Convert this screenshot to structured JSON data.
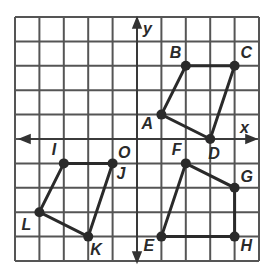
{
  "diagram": {
    "type": "coordinate-grid",
    "grid": {
      "x_min": -5,
      "x_max": 5,
      "y_min": -5,
      "y_max": 5,
      "step": 1
    },
    "axes": {
      "x_label": "x",
      "y_label": "y"
    },
    "origin_label": "O",
    "colors": {
      "grid": "#555555",
      "shape": "#2a2a2a",
      "background": "#ffffff"
    },
    "quadrilaterals": [
      {
        "name": "ABCD",
        "vertices": [
          {
            "label": "A",
            "x": 1,
            "y": 1
          },
          {
            "label": "B",
            "x": 2,
            "y": 3
          },
          {
            "label": "C",
            "x": 4,
            "y": 3
          },
          {
            "label": "D",
            "x": 3,
            "y": 0
          }
        ]
      },
      {
        "name": "EFGH",
        "vertices": [
          {
            "label": "E",
            "x": 1,
            "y": -4
          },
          {
            "label": "F",
            "x": 2,
            "y": -1
          },
          {
            "label": "G",
            "x": 4,
            "y": -2
          },
          {
            "label": "H",
            "x": 4,
            "y": -4
          }
        ]
      },
      {
        "name": "IJKL",
        "vertices": [
          {
            "label": "I",
            "x": -3,
            "y": -1
          },
          {
            "label": "J",
            "x": -1,
            "y": -1
          },
          {
            "label": "K",
            "x": -2,
            "y": -4
          },
          {
            "label": "L",
            "x": -4,
            "y": -3
          }
        ]
      }
    ]
  }
}
